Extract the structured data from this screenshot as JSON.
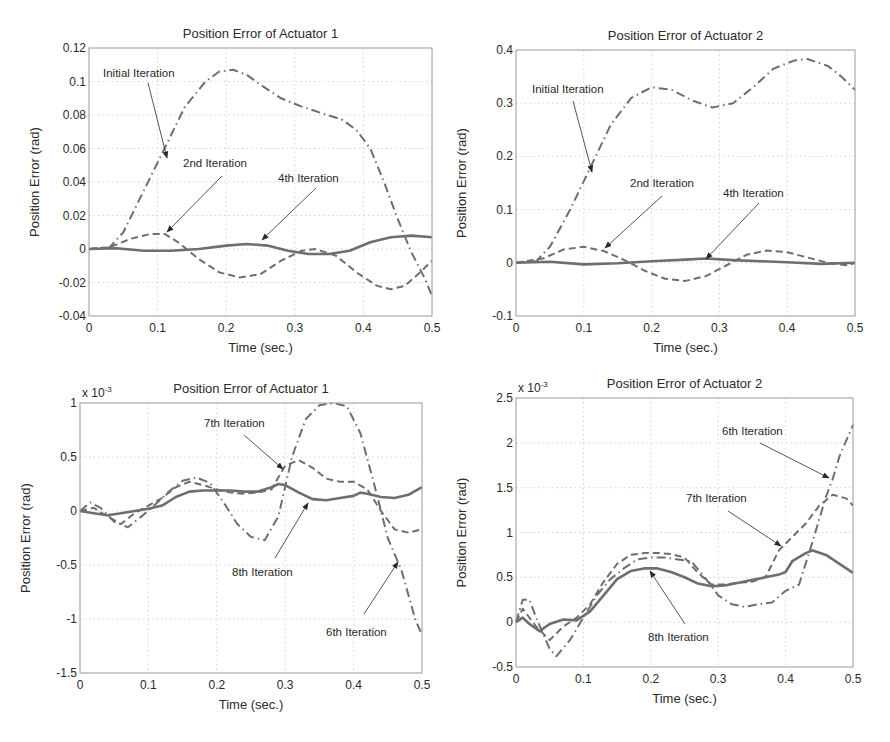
{
  "figure": {
    "width": 890,
    "height": 742,
    "line_color": "#6e6e6e",
    "text_color": "#2a2a2a",
    "arrow_color": "#2a2a2a"
  },
  "chart_data": [
    {
      "id": "p1",
      "type": "line",
      "title": "Position Error of Actuator 1",
      "xlabel": "Time (sec.)",
      "ylabel": "Position Error (rad)",
      "exponent_label": "",
      "xlim": [
        0,
        0.5
      ],
      "ylim": [
        -0.04,
        0.12
      ],
      "xticks": [
        0,
        0.1,
        0.2,
        0.3,
        0.4,
        0.5
      ],
      "xtick_labels": [
        "0",
        "0.1",
        "0.2",
        "0.3",
        "0.4",
        "0.5"
      ],
      "yticks": [
        -0.04,
        -0.02,
        0,
        0.02,
        0.04,
        0.06,
        0.08,
        0.1,
        0.12
      ],
      "ytick_labels": [
        "-0.04",
        "-0.02",
        "0",
        "0.02",
        "0.04",
        "0.06",
        "0.08",
        "0.1",
        "0.12"
      ],
      "grid": true,
      "box": {
        "left": 89,
        "top": 48,
        "right": 432,
        "bottom": 316
      },
      "series": [
        {
          "name": "Initial Iteration",
          "style": "dashdot",
          "x": [
            0,
            0.03,
            0.05,
            0.08,
            0.11,
            0.14,
            0.17,
            0.19,
            0.21,
            0.23,
            0.25,
            0.28,
            0.31,
            0.34,
            0.37,
            0.39,
            0.41,
            0.43,
            0.45,
            0.47,
            0.49,
            0.5
          ],
          "y": [
            0,
            0.001,
            0.01,
            0.035,
            0.06,
            0.085,
            0.1,
            0.106,
            0.107,
            0.104,
            0.098,
            0.09,
            0.085,
            0.081,
            0.077,
            0.071,
            0.06,
            0.04,
            0.018,
            -0.002,
            -0.018,
            -0.028
          ]
        },
        {
          "name": "2nd Iteration",
          "style": "dashed",
          "x": [
            0,
            0.03,
            0.06,
            0.09,
            0.11,
            0.13,
            0.16,
            0.19,
            0.22,
            0.25,
            0.28,
            0.31,
            0.33,
            0.36,
            0.39,
            0.42,
            0.44,
            0.46,
            0.48,
            0.5
          ],
          "y": [
            0,
            0.001,
            0.006,
            0.009,
            0.009,
            0.004,
            -0.006,
            -0.014,
            -0.017,
            -0.015,
            -0.007,
            -0.001,
            0,
            -0.004,
            -0.014,
            -0.022,
            -0.024,
            -0.022,
            -0.015,
            -0.007
          ]
        },
        {
          "name": "4th Iteration",
          "style": "solid",
          "x": [
            0,
            0.04,
            0.08,
            0.12,
            0.16,
            0.2,
            0.23,
            0.26,
            0.29,
            0.32,
            0.35,
            0.38,
            0.41,
            0.44,
            0.47,
            0.5
          ],
          "y": [
            0,
            0.0005,
            -0.001,
            -0.001,
            0,
            0.002,
            0.003,
            0.002,
            -0.001,
            -0.003,
            -0.003,
            -0.001,
            0.004,
            0.007,
            0.008,
            0.007
          ]
        }
      ],
      "annotations": [
        {
          "text": "Initial Iteration",
          "tx": 103,
          "ty": 77,
          "from": [
            148,
            83
          ],
          "to": [
            167,
            158
          ]
        },
        {
          "text": "2nd Iteration",
          "tx": 183,
          "ty": 167,
          "from": [
            222,
            176
          ],
          "to": [
            167,
            232
          ]
        },
        {
          "text": "4th Iteration",
          "tx": 278,
          "ty": 182,
          "from": [
            316,
            188
          ],
          "to": [
            262,
            240
          ]
        }
      ]
    },
    {
      "id": "p2",
      "type": "line",
      "title": "Position Error of Actuator 2",
      "xlabel": "Time (sec.)",
      "ylabel": "Position Error (rad)",
      "exponent_label": "",
      "xlim": [
        0,
        0.5
      ],
      "ylim": [
        -0.1,
        0.4
      ],
      "xticks": [
        0,
        0.1,
        0.2,
        0.3,
        0.4,
        0.5
      ],
      "xtick_labels": [
        "0",
        "0.1",
        "0.2",
        "0.3",
        "0.4",
        "0.5"
      ],
      "yticks": [
        -0.1,
        0,
        0.1,
        0.2,
        0.3,
        0.4
      ],
      "ytick_labels": [
        "-0.1",
        "0",
        "0.1",
        "0.2",
        "0.3",
        "0.4"
      ],
      "grid": true,
      "box": {
        "left": 516,
        "top": 50,
        "right": 855,
        "bottom": 316
      },
      "series": [
        {
          "name": "Initial Iteration",
          "style": "dashdot",
          "x": [
            0,
            0.03,
            0.05,
            0.08,
            0.11,
            0.14,
            0.17,
            0.2,
            0.23,
            0.26,
            0.29,
            0.32,
            0.35,
            0.38,
            0.41,
            0.43,
            0.46,
            0.48,
            0.5
          ],
          "y": [
            0,
            0.003,
            0.03,
            0.1,
            0.18,
            0.26,
            0.31,
            0.33,
            0.325,
            0.305,
            0.292,
            0.3,
            0.33,
            0.365,
            0.38,
            0.383,
            0.37,
            0.35,
            0.325
          ]
        },
        {
          "name": "2nd Iteration",
          "style": "dashed",
          "x": [
            0,
            0.04,
            0.07,
            0.1,
            0.13,
            0.16,
            0.19,
            0.22,
            0.25,
            0.28,
            0.31,
            0.34,
            0.37,
            0.4,
            0.43,
            0.46,
            0.49,
            0.5
          ],
          "y": [
            0,
            0.008,
            0.025,
            0.03,
            0.022,
            0.005,
            -0.015,
            -0.03,
            -0.034,
            -0.025,
            -0.005,
            0.015,
            0.023,
            0.02,
            0.01,
            0,
            -0.005,
            0
          ]
        },
        {
          "name": "4th Iteration",
          "style": "solid",
          "x": [
            0,
            0.05,
            0.1,
            0.15,
            0.2,
            0.25,
            0.28,
            0.32,
            0.36,
            0.4,
            0.45,
            0.5
          ],
          "y": [
            0,
            0.002,
            -0.003,
            -0.001,
            0.003,
            0.006,
            0.008,
            0.005,
            0.003,
            0.001,
            -0.002,
            0
          ]
        }
      ],
      "annotations": [
        {
          "text": "Initial Iteration",
          "tx": 532,
          "ty": 93,
          "from": [
            573,
            101
          ],
          "to": [
            592,
            172
          ]
        },
        {
          "text": "2nd Iteration",
          "tx": 630,
          "ty": 187,
          "from": [
            662,
            196
          ],
          "to": [
            605,
            248
          ]
        },
        {
          "text": "4th Iteration",
          "tx": 723,
          "ty": 197,
          "from": [
            759,
            203
          ],
          "to": [
            706,
            259
          ]
        }
      ]
    },
    {
      "id": "p3",
      "type": "line",
      "title": "Position Error of Actuator 1",
      "xlabel": "Time (sec.)",
      "ylabel": "Position Error (rad)",
      "exponent_label": "x 10",
      "exponent_power": "-3",
      "xlim": [
        0,
        0.5
      ],
      "ylim": [
        -1.5,
        1
      ],
      "xticks": [
        0,
        0.1,
        0.2,
        0.3,
        0.4,
        0.5
      ],
      "xtick_labels": [
        "0",
        "0.1",
        "0.2",
        "0.3",
        "0.4",
        "0.5"
      ],
      "yticks": [
        -1.5,
        -1,
        -0.5,
        0,
        0.5,
        1
      ],
      "ytick_labels": [
        "-1.5",
        "-1",
        "-0.5",
        "0",
        "0.5",
        "1"
      ],
      "grid": true,
      "box": {
        "left": 80,
        "top": 403,
        "right": 422,
        "bottom": 673
      },
      "series": [
        {
          "name": "6th Iteration",
          "style": "dashdot",
          "x": [
            0,
            0.015,
            0.03,
            0.05,
            0.07,
            0.09,
            0.11,
            0.13,
            0.15,
            0.17,
            0.19,
            0.21,
            0.23,
            0.25,
            0.27,
            0.29,
            0.31,
            0.33,
            0.35,
            0.37,
            0.39,
            0.41,
            0.43,
            0.45,
            0.47,
            0.49,
            0.5
          ],
          "y": [
            0,
            0.08,
            0.03,
            -0.1,
            -0.15,
            -0.05,
            0.06,
            0.18,
            0.28,
            0.31,
            0.26,
            0.08,
            -0.12,
            -0.24,
            -0.27,
            -0.05,
            0.5,
            0.85,
            0.98,
            1.0,
            0.97,
            0.72,
            0.25,
            -0.25,
            -0.55,
            -1.0,
            -1.15
          ]
        },
        {
          "name": "7th Iteration",
          "style": "dashed",
          "x": [
            0,
            0.02,
            0.04,
            0.06,
            0.08,
            0.1,
            0.12,
            0.14,
            0.16,
            0.18,
            0.2,
            0.22,
            0.24,
            0.26,
            0.28,
            0.3,
            0.32,
            0.34,
            0.36,
            0.38,
            0.4,
            0.42,
            0.44,
            0.46,
            0.48,
            0.5
          ],
          "y": [
            0,
            0.03,
            -0.05,
            -0.12,
            -0.02,
            0.05,
            0.12,
            0.22,
            0.27,
            0.24,
            0.2,
            0.17,
            0.16,
            0.17,
            0.2,
            0.42,
            0.47,
            0.4,
            0.3,
            0.27,
            0.27,
            0.2,
            0.0,
            -0.17,
            -0.2,
            -0.17
          ]
        },
        {
          "name": "8th Iteration",
          "style": "solid",
          "x": [
            0,
            0.02,
            0.04,
            0.06,
            0.08,
            0.1,
            0.12,
            0.14,
            0.16,
            0.18,
            0.2,
            0.22,
            0.24,
            0.26,
            0.28,
            0.29,
            0.3,
            0.32,
            0.34,
            0.36,
            0.38,
            0.4,
            0.41,
            0.42,
            0.44,
            0.46,
            0.48,
            0.5
          ],
          "y": [
            0,
            -0.02,
            -0.04,
            -0.02,
            0.0,
            0.02,
            0.05,
            0.13,
            0.18,
            0.19,
            0.19,
            0.19,
            0.18,
            0.18,
            0.22,
            0.25,
            0.24,
            0.17,
            0.11,
            0.1,
            0.12,
            0.14,
            0.17,
            0.16,
            0.13,
            0.12,
            0.15,
            0.22
          ]
        }
      ],
      "annotations": [
        {
          "text": "7th Iteration",
          "tx": 204,
          "ty": 427,
          "from": [
            244,
            435
          ],
          "to": [
            283,
            469
          ]
        },
        {
          "text": "8th Iteration",
          "tx": 232,
          "ty": 576,
          "from": [
            275,
            558
          ],
          "to": [
            308,
            503
          ]
        },
        {
          "text": "6th Iteration",
          "tx": 326,
          "ty": 636,
          "from": [
            364,
            614
          ],
          "to": [
            398,
            562
          ]
        }
      ]
    },
    {
      "id": "p4",
      "type": "line",
      "title": "Position Error of Actuator 2",
      "xlabel": "Time (sec.)",
      "ylabel": "Position Error (rad)",
      "exponent_label": "x 10",
      "exponent_power": "-3",
      "xlim": [
        0,
        0.5
      ],
      "ylim": [
        -0.5,
        2.5
      ],
      "xticks": [
        0,
        0.1,
        0.2,
        0.3,
        0.4,
        0.5
      ],
      "xtick_labels": [
        "0",
        "0.1",
        "0.2",
        "0.3",
        "0.4",
        "0.5"
      ],
      "yticks": [
        -0.5,
        0,
        0.5,
        1,
        1.5,
        2,
        2.5
      ],
      "ytick_labels": [
        "-0.5",
        "0",
        "0.5",
        "1",
        "1.5",
        "2",
        "2.5"
      ],
      "grid": true,
      "box": {
        "left": 516,
        "top": 398,
        "right": 853,
        "bottom": 667
      },
      "series": [
        {
          "name": "6th Iteration",
          "style": "dashdot",
          "x": [
            0,
            0.01,
            0.02,
            0.03,
            0.05,
            0.06,
            0.08,
            0.1,
            0.12,
            0.14,
            0.16,
            0.18,
            0.2,
            0.22,
            0.24,
            0.26,
            0.28,
            0.3,
            0.32,
            0.34,
            0.36,
            0.38,
            0.4,
            0.42,
            0.44,
            0.46,
            0.47,
            0.48,
            0.5
          ],
          "y": [
            0,
            0.25,
            0.25,
            0.05,
            -0.3,
            -0.38,
            -0.2,
            0.05,
            0.3,
            0.48,
            0.6,
            0.7,
            0.72,
            0.72,
            0.7,
            0.68,
            0.5,
            0.3,
            0.2,
            0.17,
            0.2,
            0.22,
            0.35,
            0.42,
            0.9,
            1.4,
            1.6,
            1.85,
            2.2
          ]
        },
        {
          "name": "7th Iteration",
          "style": "dashed",
          "x": [
            0,
            0.01,
            0.03,
            0.05,
            0.07,
            0.09,
            0.11,
            0.13,
            0.15,
            0.17,
            0.19,
            0.21,
            0.23,
            0.25,
            0.27,
            0.29,
            0.31,
            0.33,
            0.35,
            0.37,
            0.39,
            0.41,
            0.43,
            0.45,
            0.47,
            0.49,
            0.5
          ],
          "y": [
            0,
            0.15,
            -0.05,
            -0.2,
            -0.05,
            0.05,
            0.2,
            0.45,
            0.65,
            0.75,
            0.77,
            0.77,
            0.76,
            0.72,
            0.55,
            0.42,
            0.42,
            0.44,
            0.45,
            0.5,
            0.8,
            0.95,
            1.1,
            1.3,
            1.42,
            1.38,
            1.3
          ]
        },
        {
          "name": "8th Iteration",
          "style": "solid",
          "x": [
            0,
            0.01,
            0.02,
            0.035,
            0.05,
            0.07,
            0.09,
            0.11,
            0.13,
            0.15,
            0.17,
            0.19,
            0.21,
            0.23,
            0.25,
            0.27,
            0.29,
            0.31,
            0.33,
            0.35,
            0.37,
            0.39,
            0.4,
            0.41,
            0.43,
            0.44,
            0.46,
            0.48,
            0.5
          ],
          "y": [
            0,
            0.05,
            -0.02,
            -0.1,
            -0.02,
            0.03,
            0.02,
            0.12,
            0.3,
            0.48,
            0.57,
            0.6,
            0.6,
            0.56,
            0.5,
            0.43,
            0.4,
            0.41,
            0.44,
            0.47,
            0.5,
            0.53,
            0.56,
            0.68,
            0.77,
            0.8,
            0.75,
            0.65,
            0.55
          ]
        }
      ],
      "annotations": [
        {
          "text": "6th Iteration",
          "tx": 722,
          "ty": 435,
          "from": [
            760,
            443
          ],
          "to": [
            829,
            478
          ]
        },
        {
          "text": "7th Iteration",
          "tx": 686,
          "ty": 502,
          "from": [
            728,
            511
          ],
          "to": [
            781,
            546
          ]
        },
        {
          "text": "8th Iteration",
          "tx": 648,
          "ty": 641,
          "from": [
            685,
            624
          ],
          "to": [
            650,
            571
          ]
        }
      ]
    }
  ]
}
